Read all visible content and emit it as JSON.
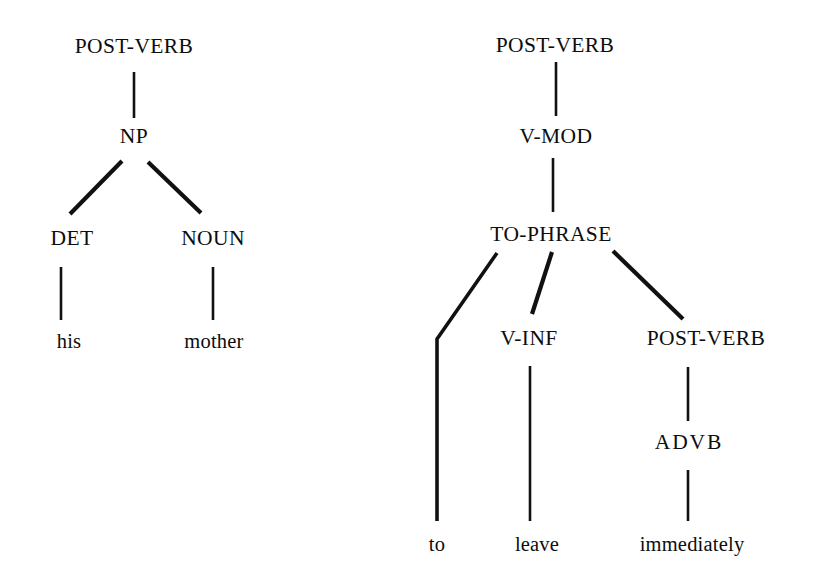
{
  "figure": {
    "type": "constituency-parse-trees",
    "background_color": "#ffffff",
    "ink_color": "#111111",
    "tree_count": 2
  },
  "left_tree": {
    "name": "left-parse-tree",
    "root": "POST-VERB",
    "sentence": "his mother",
    "nodes": {
      "root": "POST-VERB",
      "np": "NP",
      "det": "DET",
      "noun": "NOUN",
      "word_his": "his",
      "word_mother": "mother"
    }
  },
  "right_tree": {
    "name": "right-parse-tree",
    "root": "POST-VERB",
    "sentence": "to leave immediately",
    "nodes": {
      "root": "POST-VERB",
      "vmod": "V-MOD",
      "tophrase": "TO-PHRASE",
      "vinf": "V-INF",
      "postverb2": "POST-VERB",
      "advb": "ADVB",
      "word_to": "to",
      "word_leave": "leave",
      "word_immediately": "immediately"
    }
  }
}
